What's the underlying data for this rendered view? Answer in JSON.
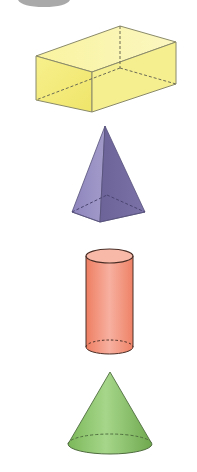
{
  "figure": {
    "shapes": [
      {
        "name": "rectangular-prism",
        "color": "#f5ee8a",
        "edge": "#8a8a6a"
      },
      {
        "name": "square-pyramid",
        "color": "#7d74ad",
        "edge": "#55507a"
      },
      {
        "name": "cylinder",
        "color": "#f08a6e",
        "edge": "#5a3a30"
      },
      {
        "name": "cone",
        "color": "#8cc46a",
        "edge": "#4f6d3f"
      }
    ],
    "top_fragment_color": "#a9a9a9"
  }
}
